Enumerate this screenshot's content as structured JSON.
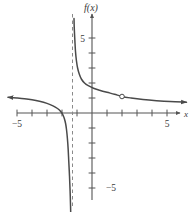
{
  "figure": {
    "title": "",
    "background_color": "#ffffff",
    "curve_color": "#4a4a4a",
    "axis_color": "#555555",
    "asymptote_color": "#8a8a8a",
    "width": 194,
    "height": 212
  },
  "labels": {
    "function_label": "f(x)",
    "x_axis_label": "x",
    "x_tick_left": "−5",
    "x_tick_right": "5",
    "y_tick_top": "5",
    "y_tick_bottom": "−5"
  },
  "chart_data": {
    "type": "line",
    "title": "",
    "xlabel": "x",
    "ylabel": "f(x)",
    "xlim": [
      -5.6,
      6.3
    ],
    "ylim": [
      -6.6,
      6.3
    ],
    "grid": false,
    "legend": null,
    "x_ticks": [
      -5,
      -4,
      -3,
      -2,
      -1,
      1,
      2,
      3,
      4,
      5
    ],
    "x_tick_labels_shown": {
      "-5": "−5",
      "5": "5"
    },
    "y_ticks": [
      -5,
      -4,
      -3,
      -2,
      -1,
      1,
      2,
      3,
      4,
      5
    ],
    "y_tick_labels_shown": {
      "5": "5",
      "-5": "−5"
    },
    "asymptotes": [
      {
        "kind": "vertical",
        "value": -1.3,
        "style": "dashed"
      },
      {
        "kind": "horizontal",
        "value": 1.0,
        "style": "implied"
      }
    ],
    "holes": [
      {
        "x": 2.0,
        "y": 1.1,
        "filled": false
      }
    ],
    "series": [
      {
        "name": "left-branch",
        "arrow_start": true,
        "arrow_end": false,
        "points": [
          [
            -5.6,
            1.05
          ],
          [
            -5.0,
            1.0
          ],
          [
            -4.5,
            0.95
          ],
          [
            -4.0,
            0.88
          ],
          [
            -3.5,
            0.78
          ],
          [
            -3.0,
            0.64
          ],
          [
            -2.6,
            0.48
          ],
          [
            -2.3,
            0.3
          ],
          [
            -2.1,
            0.12
          ],
          [
            -1.95,
            -0.1
          ],
          [
            -1.85,
            -0.35
          ],
          [
            -1.76,
            -0.7
          ],
          [
            -1.7,
            -1.1
          ],
          [
            -1.64,
            -1.7
          ],
          [
            -1.59,
            -2.4
          ],
          [
            -1.55,
            -3.2
          ],
          [
            -1.5,
            -4.2
          ],
          [
            -1.46,
            -5.2
          ],
          [
            -1.43,
            -6.2
          ],
          [
            -1.42,
            -6.6
          ]
        ]
      },
      {
        "name": "right-branch",
        "arrow_start": false,
        "arrow_end": true,
        "points": [
          [
            -1.2,
            6.3
          ],
          [
            -1.18,
            5.6
          ],
          [
            -1.14,
            4.8
          ],
          [
            -1.1,
            4.1
          ],
          [
            -1.04,
            3.5
          ],
          [
            -0.96,
            3.0
          ],
          [
            -0.85,
            2.6
          ],
          [
            -0.7,
            2.25
          ],
          [
            -0.5,
            2.0
          ],
          [
            -0.25,
            1.82
          ],
          [
            0.1,
            1.65
          ],
          [
            0.5,
            1.52
          ],
          [
            1.0,
            1.38
          ],
          [
            1.5,
            1.25
          ],
          [
            2.0,
            1.1
          ],
          [
            2.6,
            1.0
          ],
          [
            3.4,
            0.9
          ],
          [
            4.3,
            0.82
          ],
          [
            5.2,
            0.76
          ],
          [
            6.3,
            0.72
          ]
        ]
      }
    ]
  },
  "geometry": {
    "origin_px": [
      92,
      113
    ],
    "unit_px": 15.0
  }
}
